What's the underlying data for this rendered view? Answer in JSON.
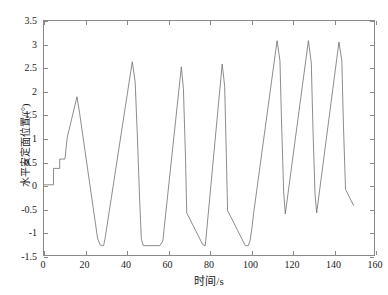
{
  "chart_data": {
    "type": "line",
    "title": "",
    "xlabel": "时间/s",
    "ylabel": "水平安定面位置/(°)",
    "xlim": [
      0,
      160
    ],
    "ylim": [
      -1.5,
      3.5
    ],
    "xticks": [
      0,
      20,
      40,
      60,
      80,
      100,
      120,
      140,
      160
    ],
    "xtick_labels": [
      "0",
      "20",
      "40",
      "60",
      "80",
      "100",
      "120",
      "140",
      "160"
    ],
    "yticks": [
      -1.5,
      -1,
      -0.5,
      0,
      0.5,
      1,
      1.5,
      2,
      2.5,
      3,
      3.5
    ],
    "ytick_labels": [
      "-1.5",
      "-1",
      "-0.5",
      "0",
      "0.5",
      "1",
      "1.5",
      "2",
      "2.5",
      "3",
      "3.5"
    ],
    "grid": false,
    "legend": null,
    "line_color": "#6e6e6e",
    "line_width": 0.8,
    "series": [
      {
        "name": "水平安定面位置",
        "x": [
          0.0,
          4.6,
          4.6,
          7.6,
          7.6,
          10.2,
          10.2,
          11.2,
          16.0,
          17.2,
          26.0,
          27.2,
          28.2,
          28.9,
          29.6,
          42.8,
          44.2,
          45.4,
          46.4,
          47.2,
          48.0,
          48.6,
          56.2,
          57.6,
          66.6,
          67.6,
          68.6,
          69.2,
          77.0,
          78.2,
          86.4,
          87.6,
          88.4,
          89.0,
          97.6,
          99.0,
          99.9,
          100.9,
          101.6,
          113.0,
          114.4,
          115.2,
          116.2,
          117.0,
          128.2,
          129.6,
          130.4,
          131.4,
          132.2,
          143.0,
          144.4,
          145.2,
          146.2,
          150.2
        ],
        "y": [
          0.0,
          0.0,
          0.35,
          0.35,
          0.55,
          0.55,
          0.56,
          1.0,
          1.88,
          1.55,
          -1.15,
          -1.28,
          -1.3,
          -1.3,
          -1.15,
          2.63,
          2.2,
          0.9,
          -0.35,
          -1.15,
          -1.29,
          -1.3,
          -1.3,
          -1.2,
          2.52,
          2.05,
          0.6,
          -0.6,
          -1.28,
          -1.3,
          2.58,
          2.1,
          0.65,
          -0.55,
          -1.3,
          -1.3,
          -1.2,
          -0.9,
          -0.62,
          3.08,
          2.65,
          1.3,
          -0.15,
          -0.62,
          3.08,
          2.6,
          1.2,
          -0.2,
          -0.6,
          3.05,
          2.65,
          1.25,
          -0.1,
          -0.45
        ]
      }
    ]
  },
  "axis": {
    "x_title": "时间/s",
    "y_title": "水平安定面位置/(°)"
  }
}
